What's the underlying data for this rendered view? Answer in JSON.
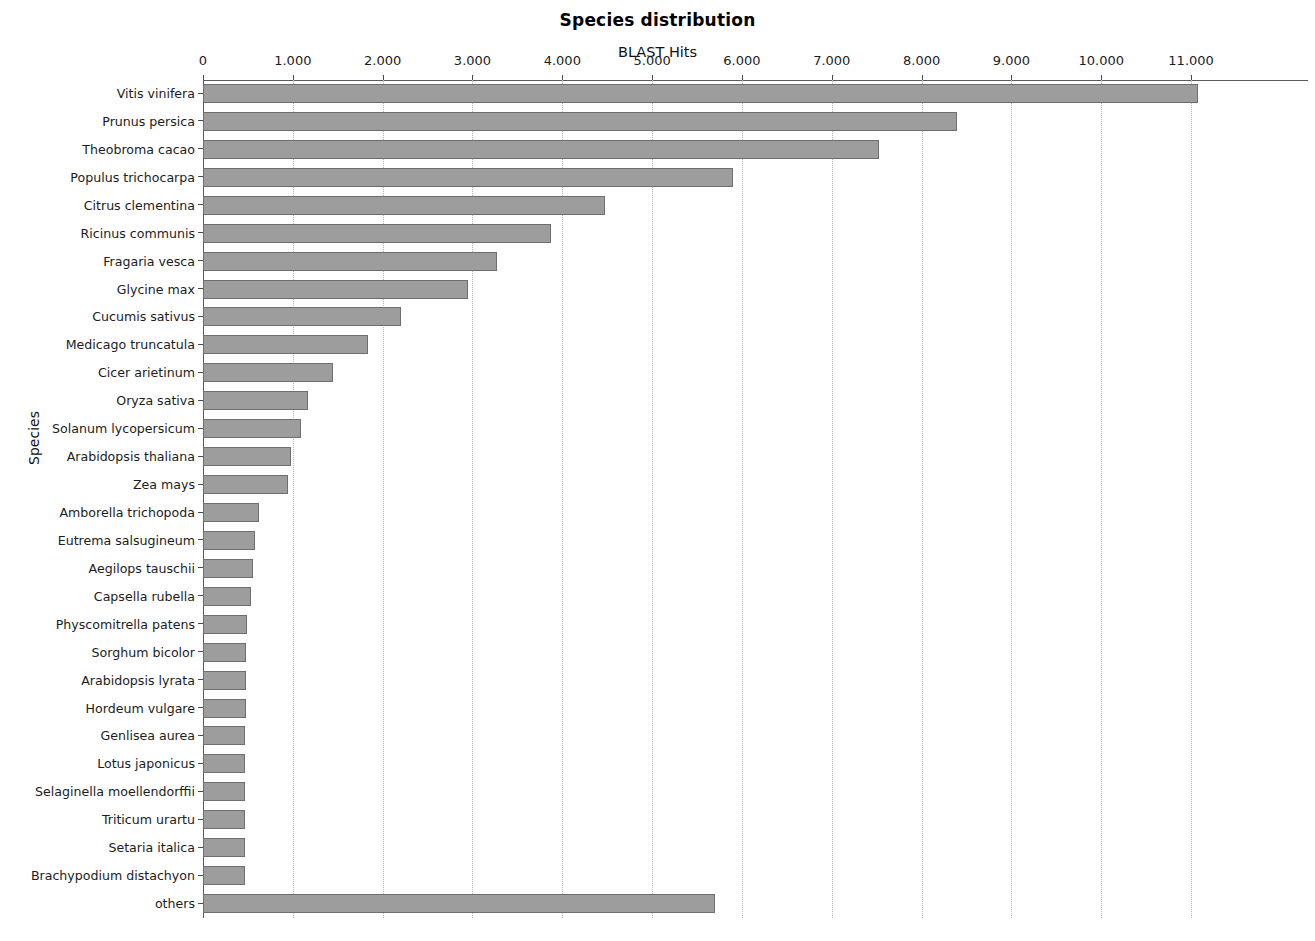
{
  "chart_data": {
    "type": "bar",
    "orientation": "horizontal",
    "title": "Species distribution",
    "xlabel": "BLAST Hits",
    "ylabel": "Species",
    "xlim": [
      0,
      11600
    ],
    "grid": true,
    "legend": null,
    "xtick_labels": [
      "0",
      "1.000",
      "2.000",
      "3.000",
      "4.000",
      "5.000",
      "6.000",
      "7.000",
      "8.000",
      "9.000",
      "10.000",
      "11.000"
    ],
    "xtick_values": [
      0,
      1000,
      2000,
      3000,
      4000,
      5000,
      6000,
      7000,
      8000,
      9000,
      10000,
      11000
    ],
    "categories": [
      "Vitis vinifera",
      "Prunus persica",
      "Theobroma cacao",
      "Populus trichocarpa",
      "Citrus clementina",
      "Ricinus communis",
      "Fragaria vesca",
      "Glycine max",
      "Cucumis sativus",
      "Medicago truncatula",
      "Cicer arietinum",
      "Oryza sativa",
      "Solanum lycopersicum",
      "Arabidopsis thaliana",
      "Zea mays",
      "Amborella trichopoda",
      "Eutrema salsugineum",
      "Aegilops tauschii",
      "Capsella rubella",
      "Physcomitrella patens",
      "Sorghum bicolor",
      "Arabidopsis lyrata",
      "Hordeum vulgare",
      "Genlisea aurea",
      "Lotus japonicus",
      "Selaginella moellendorffii",
      "Triticum urartu",
      "Setaria italica",
      "Brachypodium distachyon",
      "others"
    ],
    "values": [
      11080,
      8390,
      7530,
      5900,
      4480,
      3875,
      3275,
      2955,
      2205,
      1835,
      1445,
      1170,
      1095,
      980,
      950,
      625,
      580,
      560,
      530,
      495,
      480,
      475,
      475,
      465,
      465,
      465,
      465,
      465,
      465,
      5700
    ],
    "bar_color": "#9d9d9d",
    "bar_border_color": "#6e6e6e",
    "grid_color": "#b9b9b9",
    "axis_color": "#5a5a5a"
  }
}
